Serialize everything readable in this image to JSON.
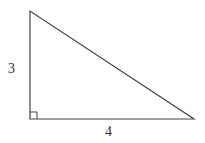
{
  "diagram": {
    "type": "right-triangle",
    "vertices": {
      "top": [
        30,
        11
      ],
      "right_angle": [
        30,
        119
      ],
      "right": [
        194,
        119
      ]
    },
    "labels": {
      "vertical_leg": "3",
      "horizontal_leg": "4"
    },
    "right_angle_marker": true,
    "stroke_color": "#444444"
  }
}
